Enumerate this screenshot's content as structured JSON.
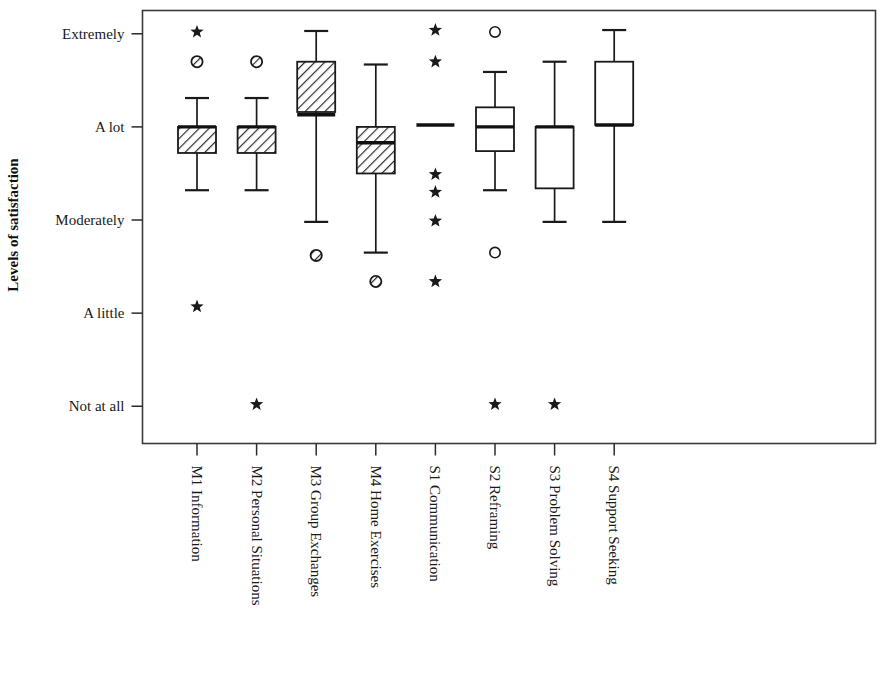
{
  "chart_data": {
    "type": "box",
    "title": "",
    "subtitle": "",
    "xlabel": "",
    "ylabel": "Levels of satisfaction",
    "grid": false,
    "legend": "none",
    "y_axis": {
      "tick_labels": [
        "Extremely",
        "A lot",
        "Moderately",
        "A little",
        "Not at all"
      ],
      "tick_values": [
        5,
        4,
        3,
        2,
        1
      ],
      "ylim": [
        0.6,
        5.25
      ]
    },
    "categories": [
      "M1 Information",
      "M2 Personal Situations",
      "M3 Group Exchanges",
      "M4 Home Exercises",
      "S1 Communication",
      "S2 Reframing",
      "S3 Problem Solving",
      "S4 Support Seeking"
    ],
    "boxes": [
      {
        "category": "M1 Information",
        "fill": "hatched",
        "whisker_low": 3.32,
        "q1": 3.72,
        "median": 4.0,
        "q3": 4.0,
        "whisker_high": 4.31,
        "outliers": [
          {
            "value": 5.02,
            "marker": "star"
          },
          {
            "value": 4.7,
            "marker": "circle-hatched"
          },
          {
            "value": 2.07,
            "marker": "star"
          }
        ]
      },
      {
        "category": "M2 Personal Situations",
        "fill": "hatched",
        "whisker_low": 3.32,
        "q1": 3.72,
        "median": 4.0,
        "q3": 4.0,
        "whisker_high": 4.31,
        "outliers": [
          {
            "value": 4.7,
            "marker": "circle-hatched"
          },
          {
            "value": 1.02,
            "marker": "star"
          }
        ]
      },
      {
        "category": "M3 Group Exchanges",
        "fill": "hatched",
        "whisker_low": 2.98,
        "q1": 4.16,
        "median": 4.13,
        "q3": 4.7,
        "whisker_high": 5.03,
        "outliers": [
          {
            "value": 2.62,
            "marker": "circle-hatched"
          }
        ]
      },
      {
        "category": "M4 Home Exercises",
        "fill": "hatched",
        "whisker_low": 2.65,
        "q1": 3.5,
        "median": 3.83,
        "q3": 4.0,
        "whisker_high": 4.67,
        "outliers": [
          {
            "value": 2.34,
            "marker": "circle-hatched"
          }
        ]
      },
      {
        "category": "S1 Communication",
        "fill": "open",
        "whisker_low": 4.02,
        "q1": 4.02,
        "median": 4.02,
        "q3": 4.02,
        "whisker_high": 4.02,
        "outliers": [
          {
            "value": 5.04,
            "marker": "star"
          },
          {
            "value": 4.7,
            "marker": "star"
          },
          {
            "value": 3.49,
            "marker": "star"
          },
          {
            "value": 3.3,
            "marker": "star"
          },
          {
            "value": 2.99,
            "marker": "star"
          },
          {
            "value": 2.34,
            "marker": "star"
          }
        ]
      },
      {
        "category": "S2 Reframing",
        "fill": "open",
        "whisker_low": 3.32,
        "q1": 3.74,
        "median": 4.0,
        "q3": 4.21,
        "whisker_high": 4.59,
        "outliers": [
          {
            "value": 5.02,
            "marker": "circle-open"
          },
          {
            "value": 2.65,
            "marker": "circle-open"
          },
          {
            "value": 1.02,
            "marker": "star"
          }
        ]
      },
      {
        "category": "S3 Problem Solving",
        "fill": "open",
        "whisker_low": 2.98,
        "q1": 3.34,
        "median": 4.0,
        "q3": 4.0,
        "whisker_high": 4.7,
        "outliers": [
          {
            "value": 1.02,
            "marker": "star"
          }
        ]
      },
      {
        "category": "S4 Support Seeking",
        "fill": "open",
        "whisker_low": 2.98,
        "q1": 4.02,
        "median": 4.02,
        "q3": 4.7,
        "whisker_high": 5.04,
        "outliers": []
      }
    ],
    "colors": {
      "axis": "#3a3a3a",
      "ink": "#1a1a1a",
      "background": "#ffffff",
      "box_open_fill": "#ffffff"
    }
  }
}
